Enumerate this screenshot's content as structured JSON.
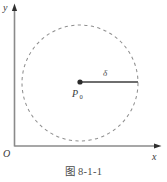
{
  "figure": {
    "caption": "图 8-1-1",
    "axes": {
      "y_label": "y",
      "x_label": "x",
      "origin_label": "O",
      "axis_color": "#8a8a8a",
      "arrow_color": "#3a3a3a"
    },
    "circle": {
      "center_x": 80,
      "center_y": 83,
      "radius": 58,
      "style": "dashed",
      "stroke_color": "#8f8f8f"
    },
    "center_point": {
      "label": "P",
      "subscript": "0",
      "dot_color": "#2b2b2b",
      "x": 80,
      "y": 82
    },
    "radius_segment": {
      "label": "δ",
      "from_x": 80,
      "from_y": 82,
      "to_x": 138,
      "to_y": 82,
      "stroke_color": "#6e6e6e"
    }
  }
}
